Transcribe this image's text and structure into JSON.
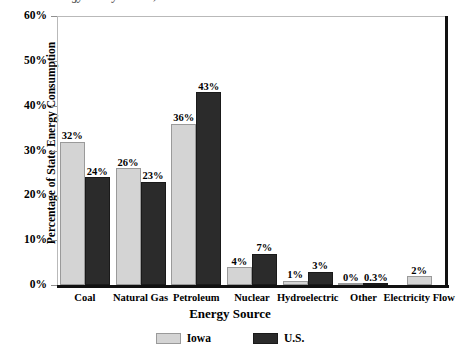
{
  "title_partial": "Iowa Energy Use by Source, 2011",
  "axis": {
    "ylabel": "Percentage of State Energy Consumption",
    "xlabel": "Energy Source"
  },
  "legend": {
    "items": [
      {
        "label": "Iowa",
        "color": "#d4d4d4"
      },
      {
        "label": "U.S.",
        "color": "#2b2b2b"
      }
    ]
  },
  "yticks": [
    "0%",
    "10%",
    "20%",
    "30%",
    "40%",
    "50%",
    "60%"
  ],
  "chart_data": {
    "type": "bar",
    "title": "Iowa Energy Use by Source, 2011",
    "xlabel": "Energy Source",
    "ylabel": "Percentage of State Energy Consumption",
    "ylim": [
      0,
      60
    ],
    "ytick_values": [
      0,
      10,
      20,
      30,
      40,
      50,
      60
    ],
    "ytick_labels": [
      "0%",
      "10%",
      "20%",
      "30%",
      "40%",
      "50%",
      "60%"
    ],
    "grid": false,
    "legend_position": "bottom",
    "categories": [
      "Coal",
      "Natural Gas",
      "Petroleum",
      "Nuclear",
      "Hydroelectric",
      "Other",
      "Electricity Flow"
    ],
    "series": [
      {
        "name": "Iowa",
        "color": "#d4d4d4",
        "values": [
          32,
          26,
          36,
          4,
          1,
          0,
          2
        ],
        "labels": [
          "32%",
          "26%",
          "36%",
          "4%",
          "1%",
          "0%",
          "2%"
        ]
      },
      {
        "name": "U.S.",
        "color": "#2b2b2b",
        "values": [
          24,
          23,
          43,
          7,
          3,
          0.3,
          null
        ],
        "labels": [
          "24%",
          "23%",
          "43%",
          "7%",
          "3%",
          "0.3%",
          ""
        ]
      }
    ]
  }
}
